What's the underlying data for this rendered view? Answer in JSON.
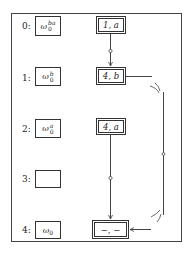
{
  "diagram": {
    "rows": [
      {
        "index": "0:",
        "history_base": "ω",
        "history_sub": "0",
        "history_sup": "ba",
        "state": "1, a",
        "has_state": true
      },
      {
        "index": "1:",
        "history_base": "ω",
        "history_sub": "0",
        "history_sup": "b",
        "state": "4, b",
        "has_state": true
      },
      {
        "index": "2:",
        "history_base": "ω",
        "history_sub": "0",
        "history_sup": "a",
        "state": "4, a",
        "has_state": true
      },
      {
        "index": "3:",
        "history_base": "",
        "history_sub": "",
        "history_sup": "",
        "state": "",
        "has_state": false
      },
      {
        "index": "4:",
        "history_base": "ω",
        "history_sub": "0",
        "history_sup": "",
        "state": "−, −",
        "has_state": true
      }
    ],
    "edges": [
      {
        "from": "1, a",
        "to": "4, b",
        "style": "arrow-with-midpoint-circle"
      },
      {
        "from": "4, a",
        "to": "−, −",
        "style": "arrow-with-midpoint-circle"
      },
      {
        "from": "4, b",
        "to": "−, −",
        "style": "loop-right-with-break-marks"
      }
    ]
  }
}
